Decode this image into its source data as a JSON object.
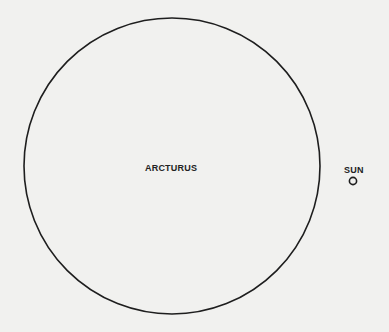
{
  "diagram": {
    "objects": [
      {
        "name": "ARCTURUS",
        "shape": "circle",
        "cx": 172,
        "cy": 166,
        "r": 148
      },
      {
        "name": "SUN",
        "shape": "circle",
        "cx": 353,
        "cy": 181,
        "r": 4
      }
    ],
    "labels": {
      "arcturus": "ARCTURUS",
      "sun": "SUN"
    },
    "colors": {
      "background": "#f1f1ef",
      "stroke": "#1e1e1e",
      "text": "#222222"
    }
  }
}
